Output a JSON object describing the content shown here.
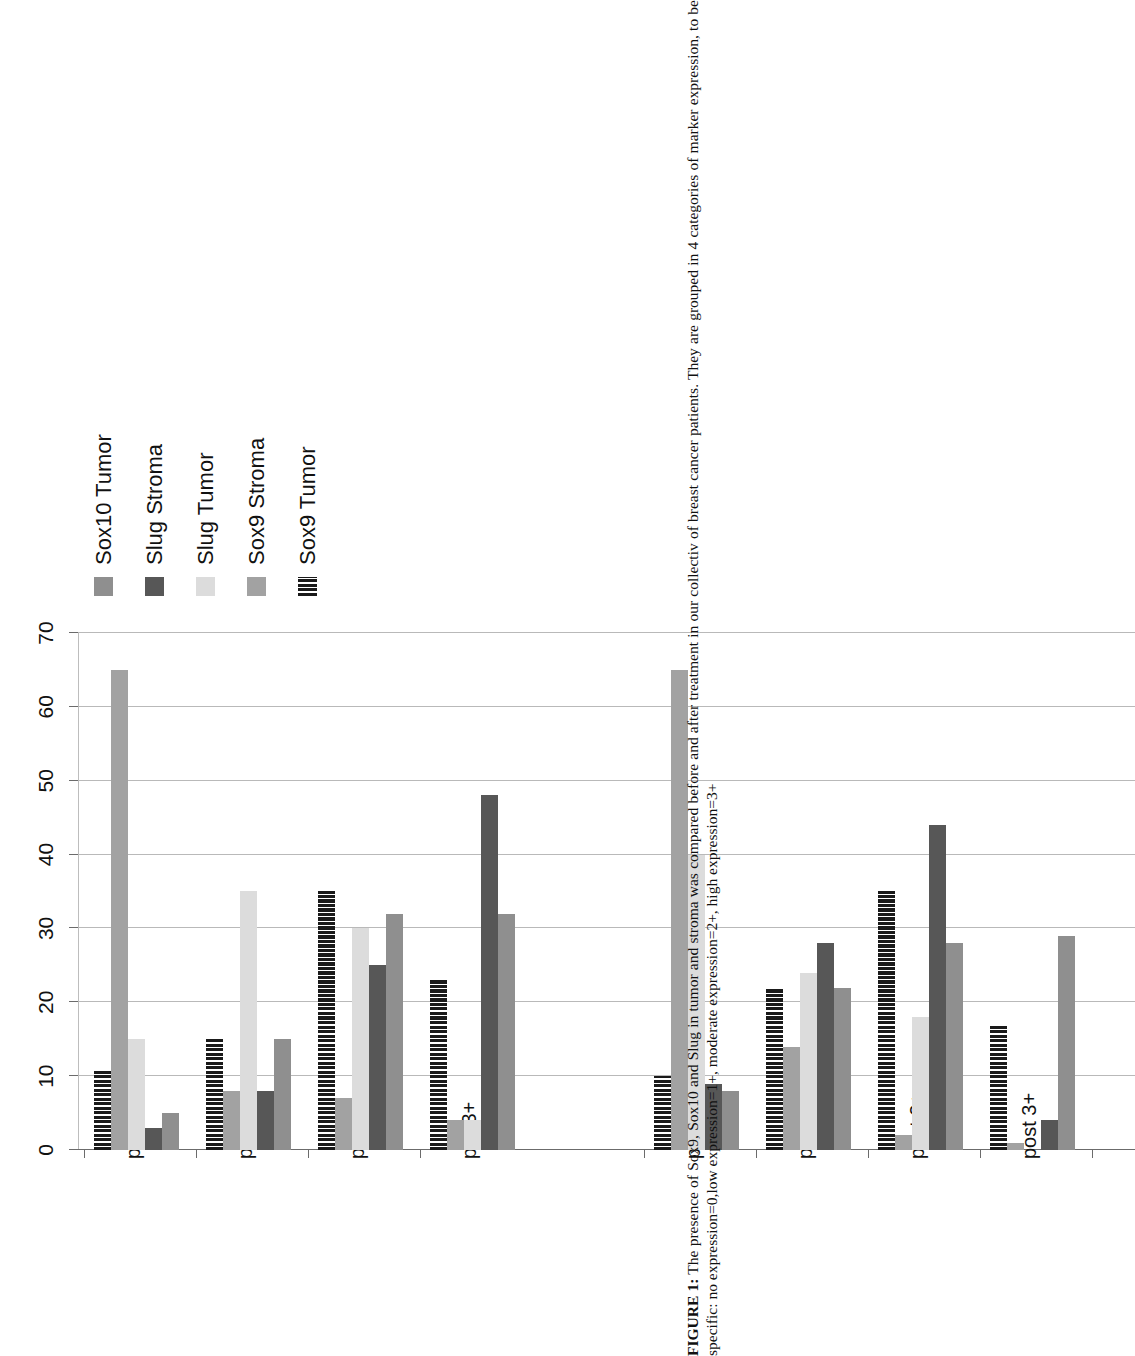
{
  "figure": {
    "caption_label": "FIGURE 1:",
    "caption_text": " The presence of Sox9, Sox10 and Slug in tumor and stroma was compared before and after treatment in our collectiv of breast cancer patients. They are grouped in 4 categories of marker expression, to be specific: no expression=0,low expression=1+, moderate expression=2+, high expression=3+"
  },
  "chart_data": {
    "type": "bar",
    "orientation": "horizontal",
    "title": "",
    "xlabel": "",
    "ylabel": "",
    "xlim": [
      0,
      70
    ],
    "xticks": [
      0,
      10,
      20,
      30,
      40,
      50,
      60,
      70
    ],
    "xtick_labels": [
      "0",
      "10",
      "20",
      "30",
      "40",
      "50",
      "60",
      "70"
    ],
    "grid": true,
    "legend_position": "right",
    "categories": [
      "pre 0",
      "pre 1+",
      "pre 2+",
      "pre 3+",
      "post 0",
      "post 1+",
      "post 2+",
      "post 3+"
    ],
    "series": [
      {
        "name": "Sox9 Tumor",
        "color": "#1a1a1a",
        "pattern": "vertical-hatch",
        "values": [
          11,
          15,
          35,
          23,
          10,
          22,
          35,
          17
        ]
      },
      {
        "name": "Sox9 Stroma",
        "color": "#a2a2a2",
        "pattern": "solid",
        "values": [
          65,
          8,
          7,
          4,
          65,
          14,
          2,
          1
        ]
      },
      {
        "name": "Slug Tumor",
        "color": "#dcdcdc",
        "pattern": "solid",
        "values": [
          15,
          35,
          30,
          4,
          40,
          24,
          18,
          0
        ]
      },
      {
        "name": "Slug Stroma",
        "color": "#575757",
        "pattern": "solid",
        "values": [
          3,
          8,
          25,
          48,
          9,
          28,
          44,
          4
        ]
      },
      {
        "name": "Sox10 Tumor",
        "color": "#8f8f8f",
        "pattern": "solid",
        "values": [
          5,
          15,
          32,
          32,
          8,
          22,
          28,
          29
        ]
      }
    ]
  }
}
